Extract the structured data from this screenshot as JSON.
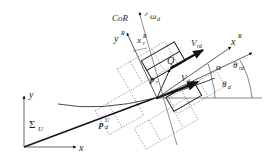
{
  "diagram": {
    "title": "",
    "frames": {
      "universal": {
        "label": "Σ",
        "sub": "U",
        "x_axis": "x",
        "y_axis": "y"
      },
      "robot": {
        "x_axis": "x",
        "x_sup": "R",
        "y_axis": "y",
        "y_sup": "R"
      }
    },
    "labels": {
      "cor": "CoR",
      "omega": "ω",
      "omega_sub": "d",
      "xr_label": "x",
      "xr_sub": "r",
      "xr_sup": "R",
      "q": "Q",
      "pr": "p",
      "pr_sub": "r",
      "vrd": "V",
      "vrd_sub": "rd",
      "vd": "V",
      "vd_sub": "d",
      "alpha": "α",
      "theta_rd": "θ",
      "theta_rd_sub": "rd",
      "theta_d": "θ",
      "theta_d_sub": "d",
      "pd": "p",
      "pd_sub": "d",
      "pd_sup": "U"
    },
    "colors": {
      "line": "#111111",
      "dotted": "#777777",
      "background": "#ffffff"
    }
  }
}
